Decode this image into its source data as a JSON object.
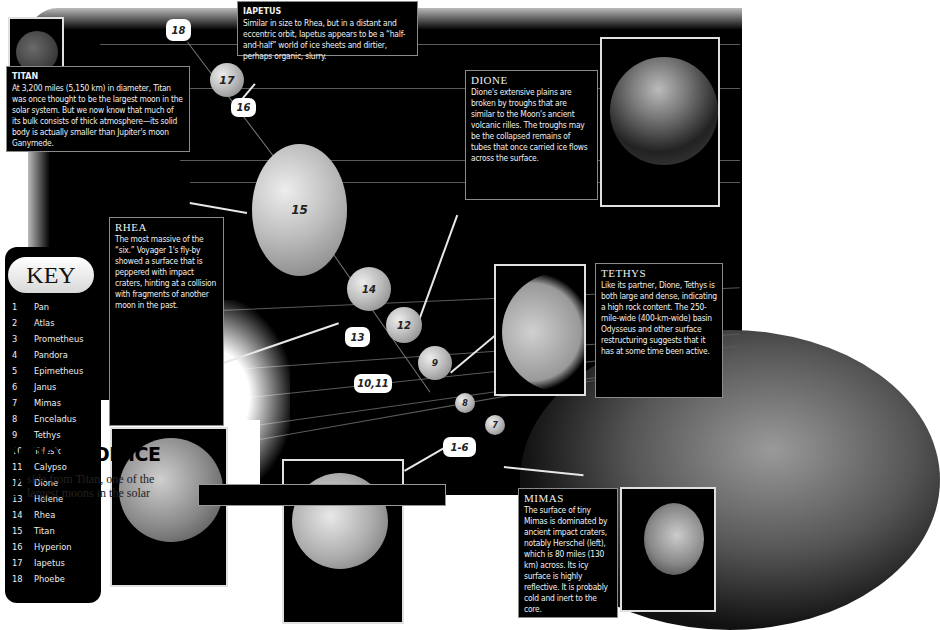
{
  "diagram": {
    "title": "MOONS OF ICE",
    "intro": {
      "dropcap": "A",
      "text_line1": "side from Titan, one of the",
      "text_line2": "largest moons in the solar"
    },
    "key": {
      "heading": "KEY",
      "items": [
        {
          "num": "1",
          "name": "Pan"
        },
        {
          "num": "2",
          "name": "Atlas"
        },
        {
          "num": "3",
          "name": "Prometheus"
        },
        {
          "num": "4",
          "name": "Pandora"
        },
        {
          "num": "5",
          "name": "Epimetheus"
        },
        {
          "num": "6",
          "name": "Janus"
        },
        {
          "num": "7",
          "name": "Mimas"
        },
        {
          "num": "8",
          "name": "Enceladus"
        },
        {
          "num": "9",
          "name": "Tethys"
        },
        {
          "num": "10",
          "name": "Telesto"
        },
        {
          "num": "11",
          "name": "Calypso"
        },
        {
          "num": "12",
          "name": "Dione"
        },
        {
          "num": "13",
          "name": "Helene"
        },
        {
          "num": "14",
          "name": "Rhea"
        },
        {
          "num": "15",
          "name": "Titan"
        },
        {
          "num": "16",
          "name": "Hyperion"
        },
        {
          "num": "17",
          "name": "Iapetus"
        },
        {
          "num": "18",
          "name": "Phoebe"
        }
      ]
    },
    "moon_markers": {
      "m15": "15",
      "m17": "17",
      "m14": "14",
      "m12": "12",
      "m9": "9",
      "m8": "8",
      "m7": "7"
    },
    "tags": {
      "t18": "18",
      "t16": "16",
      "t13": "13",
      "t1011": "10,11",
      "t16range": "1-6"
    },
    "callouts": {
      "titan": {
        "title": "TITAN",
        "text": "At 3,200 miles (5,150 km) in diameter, Titan was once thought to be the largest moon in the solar system. But we now know that much of its bulk consists of thick atmosphere—its solid body is actually smaller than Jupiter's moon Ganymede."
      },
      "iapetus": {
        "title": "IAPETUS",
        "text": "Similar in size to Rhea, but in a distant and eccentric orbit, Iapetus appears to be a “half-and-half” world of ice sheets and dirtier, perhaps organic, slurry."
      },
      "dione": {
        "title": "DIONE",
        "text": "Dione's extensive plains are broken by troughs that are similar to the Moon's ancient volcanic rilles. The troughs may be the collapsed remains of tubes that once carried ice flows across the surface."
      },
      "tethys": {
        "title": "TETHYS",
        "text": "Like its partner, Dione, Tethys is both large and dense, indicating a high rock content. The 250-mile-wide (400-km-wide) basin Odysseus and other surface restructuring suggests that it has at some time been active."
      },
      "rhea": {
        "title": "RHEA",
        "text": "The most massive of the “six.” Voyager 1's fly-by showed a surface that is peppered with impact craters, hinting at a collision with fragments of another moon in the past."
      },
      "mimas": {
        "title": "MIMAS",
        "text": "The surface of tiny Mimas is dominated by ancient impact craters, notably Herschel (left), which is 80 miles (130 km) across. Its icy surface is highly reflective. It is probably cold and inert to the core."
      }
    }
  }
}
